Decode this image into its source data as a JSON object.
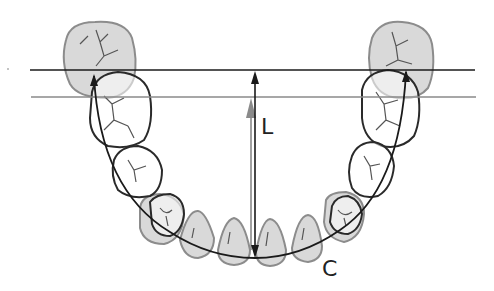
{
  "diagram": {
    "labels": {
      "depth": "L",
      "perimeter": "C"
    },
    "colors": {
      "line_dark": "#1a1a1a",
      "line_gray": "#8a8a8a",
      "tooth_fill": "#d9d9d9",
      "tooth_outline": "#8c8c8c",
      "background": "#ffffff"
    },
    "reference_lines": [
      {
        "name": "distal-reference-line",
        "y": 70,
        "x1": 30,
        "x2": 475,
        "color": "#1a1a1a"
      },
      {
        "name": "mesial-reference-line",
        "y": 97,
        "x1": 31,
        "x2": 476,
        "color": "#8a8a8a"
      }
    ],
    "measurements": [
      {
        "name": "arch-depth-L",
        "label": "L",
        "description": "Vertical depth from incisal contact to reference line"
      },
      {
        "name": "arch-perimeter-C",
        "label": "C",
        "description": "Curved arch line along dental arch"
      }
    ]
  }
}
